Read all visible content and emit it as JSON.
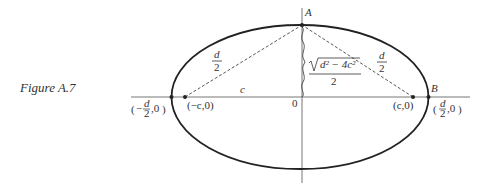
{
  "figure": {
    "caption": "Figure A.7",
    "colors": {
      "ink": "#222222",
      "axis": "#555555",
      "dashed": "#444444"
    }
  },
  "labels": {
    "point_a": "A",
    "point_b": "B",
    "origin": "0",
    "c_label": "c",
    "left_focus": "(−c,0)",
    "right_focus": "(c,0)",
    "left_half_d_num": "d",
    "left_half_d_den": "2",
    "right_half_d_num": "d",
    "right_half_d_den": "2",
    "semi_minor_num": "d² − 4c²",
    "semi_minor_den": "2",
    "left_vertex_open": "(−",
    "left_vertex_num": "d",
    "left_vertex_den": "2",
    "left_vertex_close": ",0)",
    "right_vertex_open": "(",
    "right_vertex_num": "d",
    "right_vertex_den": "2",
    "right_vertex_close": ",0)"
  }
}
